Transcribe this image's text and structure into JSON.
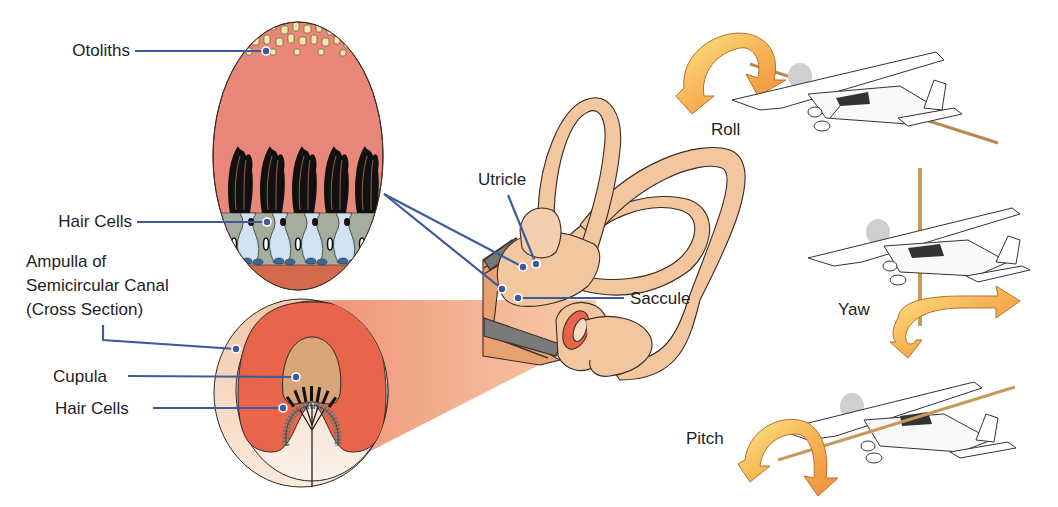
{
  "figure": {
    "type": "anatomical-diagram"
  },
  "labels": {
    "otoliths": "Otoliths",
    "hair_cells_top": "Hair Cells",
    "ampulla_line1": "Ampulla of",
    "ampulla_line2": "Semicircular Canal",
    "ampulla_line3": "(Cross Section)",
    "cupula": "Cupula",
    "hair_cells_bottom": "Hair Cells",
    "utricle": "Utricle",
    "saccule": "Saccule"
  },
  "motions": [
    {
      "id": "roll",
      "label": "Roll"
    },
    {
      "id": "yaw",
      "label": "Yaw"
    },
    {
      "id": "pitch",
      "label": "Pitch"
    }
  ],
  "colors": {
    "leader_line": "#3b5b9c",
    "tissue_pink": "#e8897a",
    "tissue_red": "#e8644a",
    "bone_tan": "#f2c7a0",
    "cupula_tan": "#d9a478",
    "arrow_orange": "#f3a04a",
    "arrow_yellow": "#fbe07a",
    "axis_rod": "#c89a5a",
    "hair_cell_blue": "#cfe3f3",
    "support_cell_gray": "#a6ad9f"
  }
}
